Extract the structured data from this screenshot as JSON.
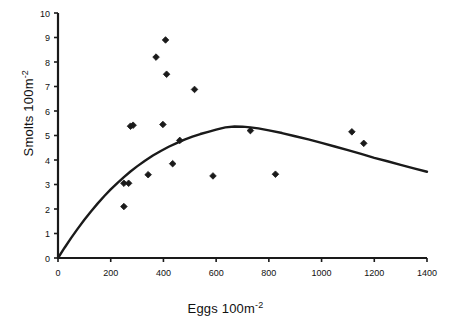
{
  "chart_data": {
    "type": "scatter",
    "title": "",
    "xlabel": "Eggs 100m-2",
    "xlabel_base": "Eggs 100m",
    "xlabel_exponent": "-2",
    "ylabel": "Smolts 100m-2",
    "ylabel_base": "Smolts 100m",
    "ylabel_exponent": "-2",
    "xlim": [
      0,
      1400
    ],
    "ylim": [
      0,
      10
    ],
    "xticks": [
      0,
      200,
      400,
      600,
      800,
      1000,
      1200,
      1400
    ],
    "yticks": [
      0,
      1,
      2,
      3,
      4,
      5,
      6,
      7,
      8,
      9,
      10
    ],
    "grid": false,
    "legend": "none",
    "marker": "filled-diamond",
    "marker_color": "#1a1a1a",
    "line_color": "#1a1a1a",
    "axis_color": "#1a1a1a",
    "points": [
      {
        "x": 250,
        "y": 2.1
      },
      {
        "x": 250,
        "y": 3.05
      },
      {
        "x": 268,
        "y": 3.05
      },
      {
        "x": 275,
        "y": 5.38
      },
      {
        "x": 285,
        "y": 5.42
      },
      {
        "x": 342,
        "y": 3.4
      },
      {
        "x": 372,
        "y": 8.2
      },
      {
        "x": 398,
        "y": 5.45
      },
      {
        "x": 408,
        "y": 8.9
      },
      {
        "x": 412,
        "y": 7.5
      },
      {
        "x": 435,
        "y": 3.85
      },
      {
        "x": 462,
        "y": 4.8
      },
      {
        "x": 518,
        "y": 6.88
      },
      {
        "x": 588,
        "y": 3.35
      },
      {
        "x": 730,
        "y": 5.2
      },
      {
        "x": 825,
        "y": 3.42
      },
      {
        "x": 1115,
        "y": 5.15
      },
      {
        "x": 1160,
        "y": 4.68
      }
    ],
    "curve": {
      "name": "Ricker fitted curve",
      "peak_x": 635,
      "peak_y": 5.37,
      "end_x": 1400,
      "end_y": 3.52,
      "series": [
        {
          "x": 0,
          "y": 0.0
        },
        {
          "x": 25,
          "y": 0.42
        },
        {
          "x": 50,
          "y": 0.82
        },
        {
          "x": 75,
          "y": 1.2
        },
        {
          "x": 100,
          "y": 1.56
        },
        {
          "x": 125,
          "y": 1.9
        },
        {
          "x": 150,
          "y": 2.22
        },
        {
          "x": 175,
          "y": 2.52
        },
        {
          "x": 200,
          "y": 2.8
        },
        {
          "x": 225,
          "y": 3.06
        },
        {
          "x": 250,
          "y": 3.3
        },
        {
          "x": 275,
          "y": 3.53
        },
        {
          "x": 300,
          "y": 3.74
        },
        {
          "x": 330,
          "y": 3.97
        },
        {
          "x": 360,
          "y": 4.18
        },
        {
          "x": 390,
          "y": 4.37
        },
        {
          "x": 420,
          "y": 4.54
        },
        {
          "x": 450,
          "y": 4.69
        },
        {
          "x": 480,
          "y": 4.83
        },
        {
          "x": 510,
          "y": 4.95
        },
        {
          "x": 540,
          "y": 5.06
        },
        {
          "x": 570,
          "y": 5.15
        },
        {
          "x": 600,
          "y": 5.24
        },
        {
          "x": 635,
          "y": 5.33
        },
        {
          "x": 670,
          "y": 5.37
        },
        {
          "x": 700,
          "y": 5.36
        },
        {
          "x": 730,
          "y": 5.33
        },
        {
          "x": 760,
          "y": 5.29
        },
        {
          "x": 800,
          "y": 5.21
        },
        {
          "x": 850,
          "y": 5.1
        },
        {
          "x": 900,
          "y": 4.97
        },
        {
          "x": 950,
          "y": 4.84
        },
        {
          "x": 1000,
          "y": 4.7
        },
        {
          "x": 1050,
          "y": 4.55
        },
        {
          "x": 1100,
          "y": 4.4
        },
        {
          "x": 1150,
          "y": 4.25
        },
        {
          "x": 1200,
          "y": 4.09
        },
        {
          "x": 1250,
          "y": 3.95
        },
        {
          "x": 1300,
          "y": 3.8
        },
        {
          "x": 1350,
          "y": 3.66
        },
        {
          "x": 1400,
          "y": 3.52
        }
      ]
    }
  }
}
